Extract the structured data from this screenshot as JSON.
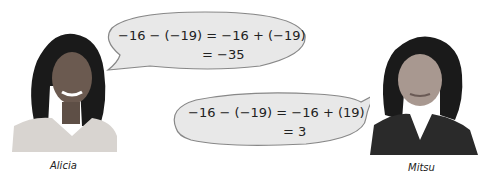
{
  "people": [
    {
      "name": "Alicia",
      "equation_line1": "−16 − (−19) = −16 + (−19)",
      "equation_line2": "= −35"
    },
    {
      "name": "Mitsu",
      "equation_line1": "−16 − (−19) = −16 + (19)",
      "equation_line2": "= 3"
    }
  ]
}
